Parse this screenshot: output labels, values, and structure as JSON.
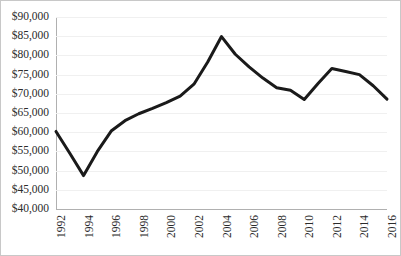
{
  "chart_data": {
    "type": "line",
    "title": "",
    "subtitle": "",
    "xlabel": "",
    "ylabel": "",
    "grid": true,
    "legend": false,
    "legend_position": "none",
    "line_color": "#1a1a1a",
    "grid_color": "#f0f0f0",
    "axis_color": "#b0b0b0",
    "x": [
      1992,
      1993,
      1994,
      1995,
      1996,
      1997,
      1998,
      1999,
      2000,
      2001,
      2002,
      2003,
      2004,
      2005,
      2006,
      2007,
      2008,
      2009,
      2010,
      2011,
      2012,
      2013,
      2014,
      2015,
      2016
    ],
    "values": [
      60200,
      54500,
      48700,
      55000,
      60300,
      63000,
      64800,
      66200,
      67700,
      69400,
      72500,
      78300,
      84900,
      80300,
      77000,
      74100,
      71600,
      70900,
      68500,
      72700,
      76600,
      75800,
      75000,
      72100,
      68600
    ],
    "xlim": [
      1992,
      2016
    ],
    "ylim": [
      40000,
      90000
    ],
    "y_ticks": [
      40000,
      45000,
      50000,
      55000,
      60000,
      65000,
      70000,
      75000,
      80000,
      85000,
      90000
    ],
    "y_tick_labels": [
      "$40,000",
      "$45,000",
      "$50,000",
      "$55,000",
      "$60,000",
      "$65,000",
      "$70,000",
      "$75,000",
      "$80,000",
      "$85,000",
      "$90,000"
    ],
    "x_ticks": [
      1992,
      1994,
      1996,
      1998,
      2000,
      2002,
      2004,
      2006,
      2008,
      2010,
      2012,
      2014,
      2016
    ],
    "x_tick_labels": [
      "1992",
      "1994",
      "1996",
      "1998",
      "2000",
      "2002",
      "2004",
      "2006",
      "2008",
      "2010",
      "2012",
      "2014",
      "2016"
    ],
    "x_tick_rotation": 90,
    "annotations": []
  }
}
